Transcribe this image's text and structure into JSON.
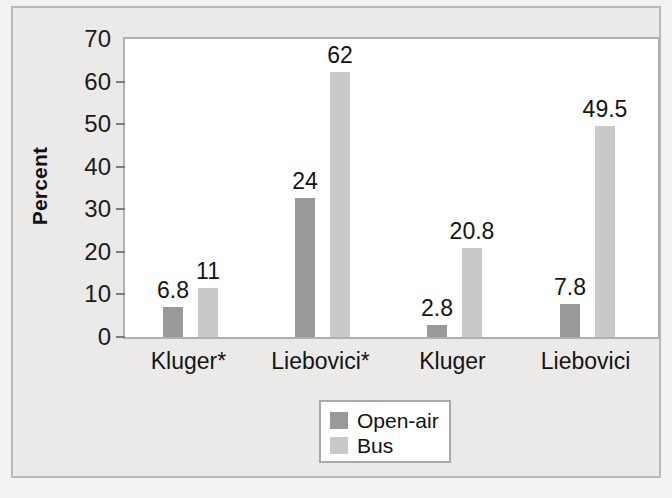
{
  "chart_data": {
    "type": "bar",
    "title": "",
    "xlabel": "",
    "ylabel": "Percent",
    "ylim": [
      0,
      70
    ],
    "yticks": [
      0,
      10,
      20,
      30,
      40,
      50,
      60,
      70
    ],
    "grid": false,
    "legend_position": "bottom-center",
    "categories": [
      "Kluger*",
      "Liebovici*",
      "Kluger",
      "Liebovici"
    ],
    "series": [
      {
        "name": "Open-air",
        "color": "#999999",
        "values": [
          6.8,
          24,
          2.8,
          7.8
        ],
        "labels": [
          "6.8",
          "24",
          "2.8",
          "7.8"
        ],
        "plotted_heights": [
          7.0,
          32.6,
          2.8,
          7.8
        ]
      },
      {
        "name": "Bus",
        "color": "#c9c9c9",
        "values": [
          11,
          62,
          20.8,
          49.5
        ],
        "labels": [
          "11",
          "62",
          "20.8",
          "49.5"
        ],
        "plotted_heights": [
          11.5,
          62.2,
          20.8,
          49.5
        ]
      }
    ]
  },
  "axis": {
    "y_title": "Percent",
    "tick_labels": [
      "70",
      "60",
      "50",
      "40",
      "30",
      "20",
      "10",
      "0"
    ]
  },
  "legend": {
    "entries": [
      {
        "label": "Open-air",
        "swatch": "#999999"
      },
      {
        "label": "Bus",
        "swatch": "#c9c9c9"
      }
    ]
  }
}
